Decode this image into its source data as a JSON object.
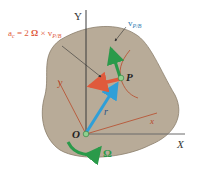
{
  "figure": {
    "axis_X_label": "X",
    "axis_Y_label": "Y",
    "axis_x_label": "x",
    "axis_y_label": "y",
    "origin_label": "O",
    "point_label": "P",
    "position_vector_label": "r",
    "angular_velocity_label": "Ω",
    "relative_velocity_label": "v",
    "relative_velocity_subscript": "P/B",
    "coriolis_equation_prefix": "a",
    "coriolis_equation_prefix_sub": "c",
    "coriolis_equation_body": " = 2 ",
    "coriolis_equation_omega": "Ω",
    "coriolis_equation_times": " × v",
    "coriolis_equation_sub": "P/B"
  },
  "colors": {
    "body_fill": "#b8ab98",
    "body_stroke": "#8a7d6b",
    "coriolis_arrow": "#e05a3c",
    "velocity_arrow": "#2a9a4a",
    "position_arrow": "#2f9fd8",
    "curve": "#b84a2a",
    "axis": "#3a3a3a"
  }
}
